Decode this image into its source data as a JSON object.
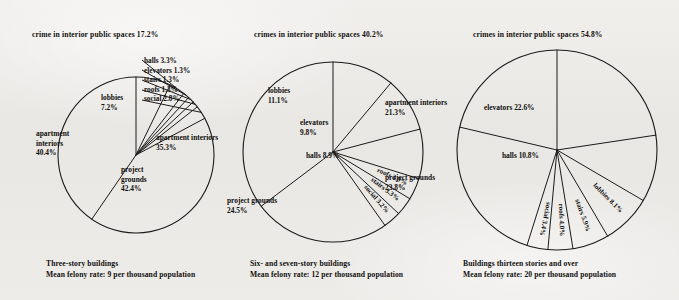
{
  "figure": {
    "background_color": "#eceae7",
    "ink_color": "#141414"
  },
  "chart_data": [
    {
      "type": "pie",
      "id": "three-story",
      "title": "crime in interior public spaces 17.2%",
      "caption_line1": "Three-story buildings",
      "caption_line2": "Mean felony rate: 9 per thousand population",
      "categories": [
        "lobbies",
        "halls",
        "elevators",
        "stairs",
        "roofs",
        "social",
        "project grounds",
        "apartment interiors"
      ],
      "values": [
        7.2,
        3.3,
        1.3,
        1.3,
        1.3,
        2.8,
        42.4,
        40.4
      ],
      "labels": [
        "lobbies 7.2%",
        "halls 3.3%",
        "elevators 1.3%",
        "stairs 1.3%",
        "roofs 1.3%",
        "social 2.8%",
        "project grounds 42.4%",
        "apartment interiors 40.4%"
      ],
      "interior_total": 17.2,
      "mean_felony_rate": 9,
      "start_angle_deg": 0,
      "direction": "clockwise"
    },
    {
      "type": "pie",
      "id": "six-seven-story",
      "title": "crimes in interior public spaces 40.2%",
      "caption_line1": "Six- and seven-story buildings",
      "caption_line2": "Mean felony rate: 12 per thousand population",
      "categories": [
        "lobbies",
        "elevators",
        "halls",
        "roofs",
        "stairs",
        "social",
        "project grounds",
        "apartment interiors"
      ],
      "values": [
        11.1,
        9.8,
        8.9,
        3.9,
        3.3,
        3.2,
        24.5,
        35.3
      ],
      "labels": [
        "lobbies 11.1%",
        "elevators 9.8%",
        "halls 8.9%",
        "roofs 3.9%",
        "stairs 3.3%",
        "social 3.2%",
        "project grounds 24.5%",
        "apartment interiors 35.3%"
      ],
      "interior_total": 40.2,
      "mean_felony_rate": 12,
      "start_angle_deg": 0,
      "direction": "clockwise"
    },
    {
      "type": "pie",
      "id": "thirteen-plus-story",
      "title": "crimes in interior public spaces 54.8%",
      "caption_line1": "Buildings thirteen stories and over",
      "caption_line2": "Mean felony rate: 20 per thousand population",
      "categories": [
        "elevators",
        "halls",
        "lobbies",
        "stairs",
        "roofs",
        "social",
        "project grounds",
        "apartment interiors"
      ],
      "values": [
        22.6,
        10.8,
        8.1,
        5.9,
        4.0,
        3.4,
        23.8,
        21.3
      ],
      "labels": [
        "elevators 22.6%",
        "halls 10.8%",
        "lobbies 8.1%",
        "stairs 5.9%",
        "roofs 4.0%",
        "social 3.4%",
        "project grounds 23.8%",
        "apartment interiors 21.3%"
      ],
      "interior_total": 54.8,
      "mean_felony_rate": 20,
      "start_angle_deg": 0,
      "direction": "clockwise"
    }
  ]
}
